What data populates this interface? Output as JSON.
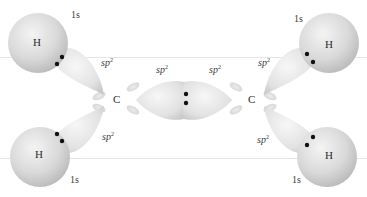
{
  "diagram": {
    "atoms": {
      "carbon_left": "C",
      "carbon_right": "C",
      "h_top_left": "H",
      "h_bottom_left": "H",
      "h_top_right": "H",
      "h_bottom_right": "H"
    },
    "orbital_labels": {
      "h_top_left": "1s",
      "h_bottom_left": "1s",
      "h_top_right": "1s",
      "h_bottom_right": "1s",
      "sp2_top_left": "sp",
      "sp2_bottom_left": "sp",
      "sp2_top_right": "sp",
      "sp2_bottom_right": "sp",
      "sp2_center_left": "sp",
      "sp2_center_right": "sp",
      "superscript": "2"
    },
    "electron_pairs": 5,
    "colors": {
      "sphere_light": "#f0f0f0",
      "sphere_dark": "#bdbdbd",
      "lobe_light": "#f5f5f5",
      "lobe_dark": "#cfcfcf",
      "electron": "#111111",
      "guide_line": "#e6e6e6"
    }
  }
}
